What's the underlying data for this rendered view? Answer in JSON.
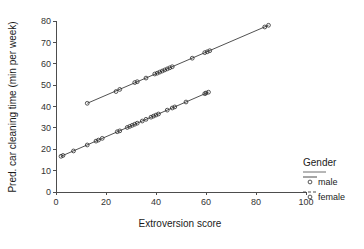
{
  "chart_data": {
    "type": "scatter",
    "title": "",
    "xlabel": "Extroversion score",
    "ylabel": "Pred. car cleaning time (min per week)",
    "xlim": [
      0,
      100
    ],
    "ylim": [
      0,
      80
    ],
    "xticks": [
      0,
      20,
      40,
      60,
      80,
      100
    ],
    "yticks": [
      0,
      10,
      20,
      30,
      40,
      50,
      60,
      70,
      80
    ],
    "grid": false,
    "legend": {
      "title": "Gender",
      "position": "right",
      "entries": [
        {
          "label": "male",
          "line_style": "solid",
          "marker": "open-circle"
        },
        {
          "label": "female",
          "line_style": "dashed",
          "marker": "open-circle"
        }
      ]
    },
    "series": [
      {
        "name": "male",
        "line_style": "solid",
        "marker": "open-circle",
        "fit_line": {
          "x": [
            12.5,
            85.0
          ],
          "y": [
            41.5,
            78.0
          ],
          "slope": 0.503,
          "intercept": 35.21
        },
        "points": [
          {
            "x": 12.5,
            "y": 41.5
          },
          {
            "x": 24.0,
            "y": 47.0
          },
          {
            "x": 25.5,
            "y": 48.0
          },
          {
            "x": 31.5,
            "y": 51.2
          },
          {
            "x": 32.5,
            "y": 51.6
          },
          {
            "x": 36.0,
            "y": 53.3
          },
          {
            "x": 39.5,
            "y": 55.2
          },
          {
            "x": 40.5,
            "y": 55.6
          },
          {
            "x": 41.5,
            "y": 56.1
          },
          {
            "x": 42.5,
            "y": 56.6
          },
          {
            "x": 43.5,
            "y": 57.1
          },
          {
            "x": 44.5,
            "y": 57.6
          },
          {
            "x": 45.5,
            "y": 58.1
          },
          {
            "x": 46.5,
            "y": 58.6
          },
          {
            "x": 54.5,
            "y": 62.6
          },
          {
            "x": 59.5,
            "y": 65.2
          },
          {
            "x": 60.5,
            "y": 65.6
          },
          {
            "x": 61.5,
            "y": 66.1
          },
          {
            "x": 83.5,
            "y": 77.2
          },
          {
            "x": 85.0,
            "y": 78.0
          }
        ]
      },
      {
        "name": "female",
        "line_style": "dashed",
        "marker": "open-circle",
        "fit_line": {
          "x": [
            2.0,
            61.0
          ],
          "y": [
            16.7,
            46.7
          ],
          "slope": 0.508,
          "intercept": 15.68
        },
        "points": [
          {
            "x": 2.0,
            "y": 16.7
          },
          {
            "x": 2.8,
            "y": 17.1
          },
          {
            "x": 7.0,
            "y": 19.2
          },
          {
            "x": 12.5,
            "y": 22.0
          },
          {
            "x": 16.0,
            "y": 23.8
          },
          {
            "x": 17.0,
            "y": 24.3
          },
          {
            "x": 18.5,
            "y": 25.1
          },
          {
            "x": 24.5,
            "y": 28.2
          },
          {
            "x": 25.5,
            "y": 28.6
          },
          {
            "x": 28.5,
            "y": 30.2
          },
          {
            "x": 29.5,
            "y": 30.7
          },
          {
            "x": 30.5,
            "y": 31.2
          },
          {
            "x": 31.5,
            "y": 31.7
          },
          {
            "x": 32.5,
            "y": 32.2
          },
          {
            "x": 34.5,
            "y": 33.2
          },
          {
            "x": 36.0,
            "y": 34.0
          },
          {
            "x": 38.0,
            "y": 35.0
          },
          {
            "x": 39.0,
            "y": 35.5
          },
          {
            "x": 40.0,
            "y": 36.0
          },
          {
            "x": 41.0,
            "y": 36.5
          },
          {
            "x": 44.5,
            "y": 38.3
          },
          {
            "x": 46.5,
            "y": 39.3
          },
          {
            "x": 47.5,
            "y": 39.8
          },
          {
            "x": 52.0,
            "y": 42.1
          },
          {
            "x": 59.5,
            "y": 46.0
          },
          {
            "x": 60.0,
            "y": 46.3
          },
          {
            "x": 61.0,
            "y": 46.7
          }
        ]
      }
    ]
  },
  "colors": {
    "axis": "#4d4d4d",
    "marker": "#2b2b2b",
    "line": "#3d3d3d",
    "text": "#1a1a1a",
    "background": "#ffffff"
  }
}
